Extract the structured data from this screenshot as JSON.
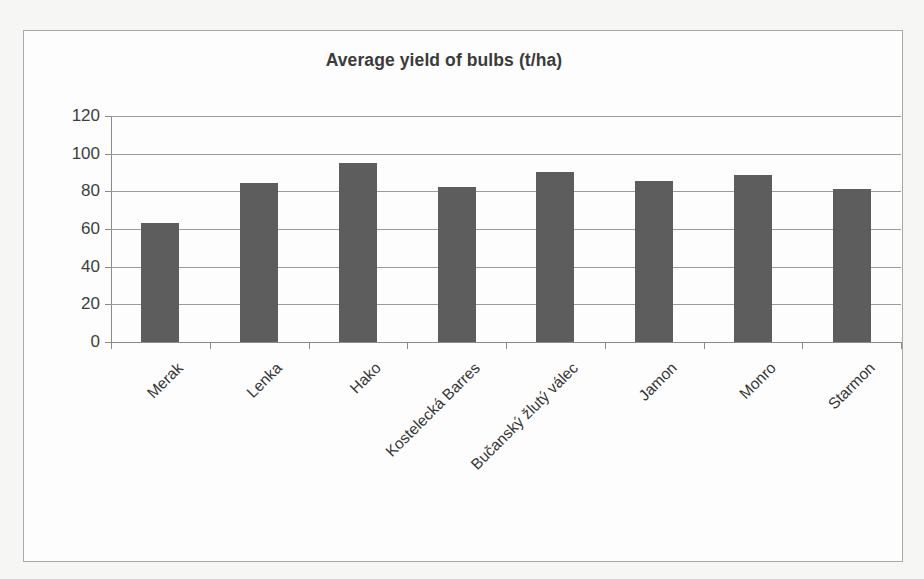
{
  "chart_data": {
    "type": "bar",
    "title": "Average yield of bulbs (t/ha)",
    "xlabel": "",
    "ylabel": "",
    "ylim": [
      0,
      120
    ],
    "yticks": [
      0,
      20,
      40,
      60,
      80,
      100,
      120
    ],
    "grid": true,
    "legend": "none",
    "orientation": "vertical",
    "bar_color": "#5d5d5d",
    "categories": [
      "Merak",
      "Lenka",
      "Hako",
      "Kostelecká Barres",
      "Bučanský žlutý válec",
      "Jamon",
      "Monro",
      "Starmon"
    ],
    "values": [
      63,
      84.5,
      95,
      82.5,
      90.5,
      85.5,
      88.5,
      81
    ],
    "series": [
      {
        "name": "Average yield of bulbs (t/ha)",
        "values": [
          63,
          84.5,
          95,
          82.5,
          90.5,
          85.5,
          88.5,
          81
        ]
      }
    ]
  },
  "axis": {
    "y_tick_labels": [
      "120",
      "100",
      "80",
      "60",
      "40",
      "20",
      "0"
    ]
  },
  "colors": {
    "bar": "#5d5d5d",
    "grid": "#9b9b9b",
    "axis": "#8a8a8a",
    "frame": "#a8a8a8",
    "plot_background": "#fdfdfd",
    "page_background": "#f6f6f5",
    "title_text": "#3b3b3b",
    "label_text": "#3d3d3d"
  }
}
